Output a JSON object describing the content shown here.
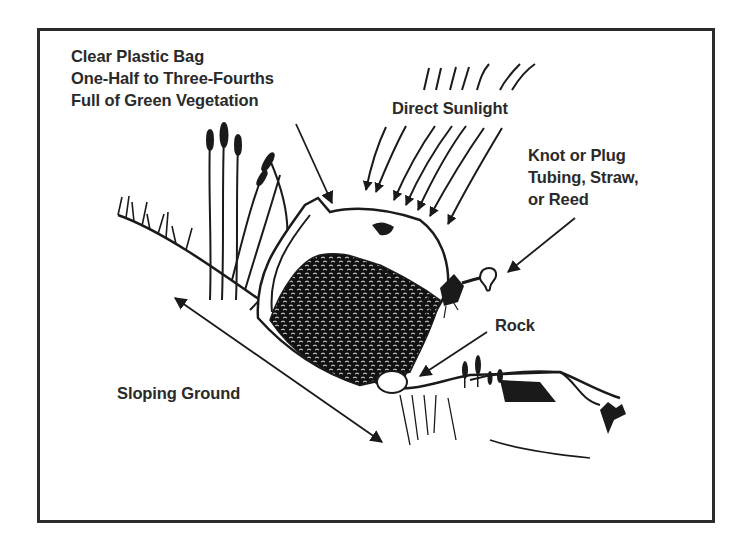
{
  "diagram": {
    "labels": {
      "bag": {
        "lines": [
          "Clear Plastic Bag",
          "One-Half to Three-Fourths",
          "Full of Green Vegetation"
        ]
      },
      "sunlight": {
        "text": "Direct Sunlight"
      },
      "knot": {
        "lines": [
          "Knot or Plug",
          "Tubing, Straw,",
          "or Reed"
        ]
      },
      "rock": {
        "text": "Rock"
      },
      "slope": {
        "text": "Sloping Ground"
      }
    },
    "components": [
      {
        "name": "plastic-bag",
        "description": "Clear plastic bag partially filled with green vegetation"
      },
      {
        "name": "sun-rays",
        "description": "Direct sunlight shown as curved arrows"
      },
      {
        "name": "knot-tubing",
        "description": "Knot or plug with tubing at bag mouth"
      },
      {
        "name": "rock",
        "description": "Rock placed under low end of bag"
      },
      {
        "name": "slope",
        "description": "Double-headed arrow indicating sloping ground"
      }
    ],
    "colors": {
      "ink": "#1a1a1a",
      "text": "#2a2a2a",
      "frame": "#2b2b2b",
      "background": "#ffffff"
    }
  }
}
